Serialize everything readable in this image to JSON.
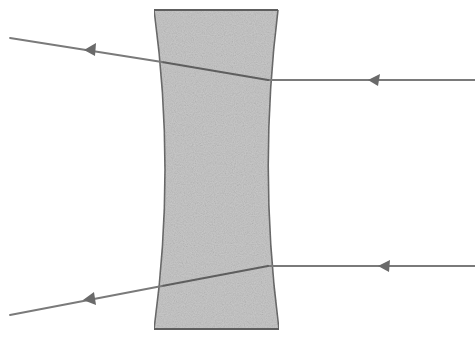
{
  "diagram": {
    "title": "Concave (diverging) lens ray diagram",
    "colors": {
      "background": "#ffffff",
      "lens_fill": "#c9c9c9",
      "lens_outline": "#6e6e6e",
      "ray": "#7a7a7a",
      "arrowhead": "#6a6a6a"
    },
    "lens": {
      "type": "biconcave",
      "top_left": [
        154,
        10
      ],
      "top_right": [
        278,
        10
      ],
      "bottom_left": [
        154,
        329
      ],
      "bottom_right": [
        279,
        329
      ],
      "waist_left_x": 166,
      "waist_right_x": 265
    },
    "rays": [
      {
        "name": "upper-ray",
        "direction": "right-to-left",
        "incident": [
          [
            475,
            80
          ],
          [
            268,
            80
          ]
        ],
        "inside": [
          [
            268,
            80
          ],
          [
            162,
            62
          ]
        ],
        "emergent": [
          [
            162,
            62
          ],
          [
            10,
            38
          ]
        ],
        "arrows": [
          [
            376,
            80
          ],
          [
            90,
            52
          ]
        ]
      },
      {
        "name": "lower-ray",
        "direction": "right-to-left",
        "incident": [
          [
            475,
            266
          ],
          [
            268,
            266
          ]
        ],
        "inside": [
          [
            268,
            266
          ],
          [
            162,
            286
          ]
        ],
        "emergent": [
          [
            162,
            286
          ],
          [
            10,
            315
          ]
        ],
        "arrows": [
          [
            386,
            266
          ],
          [
            90,
            300
          ]
        ]
      }
    ]
  }
}
